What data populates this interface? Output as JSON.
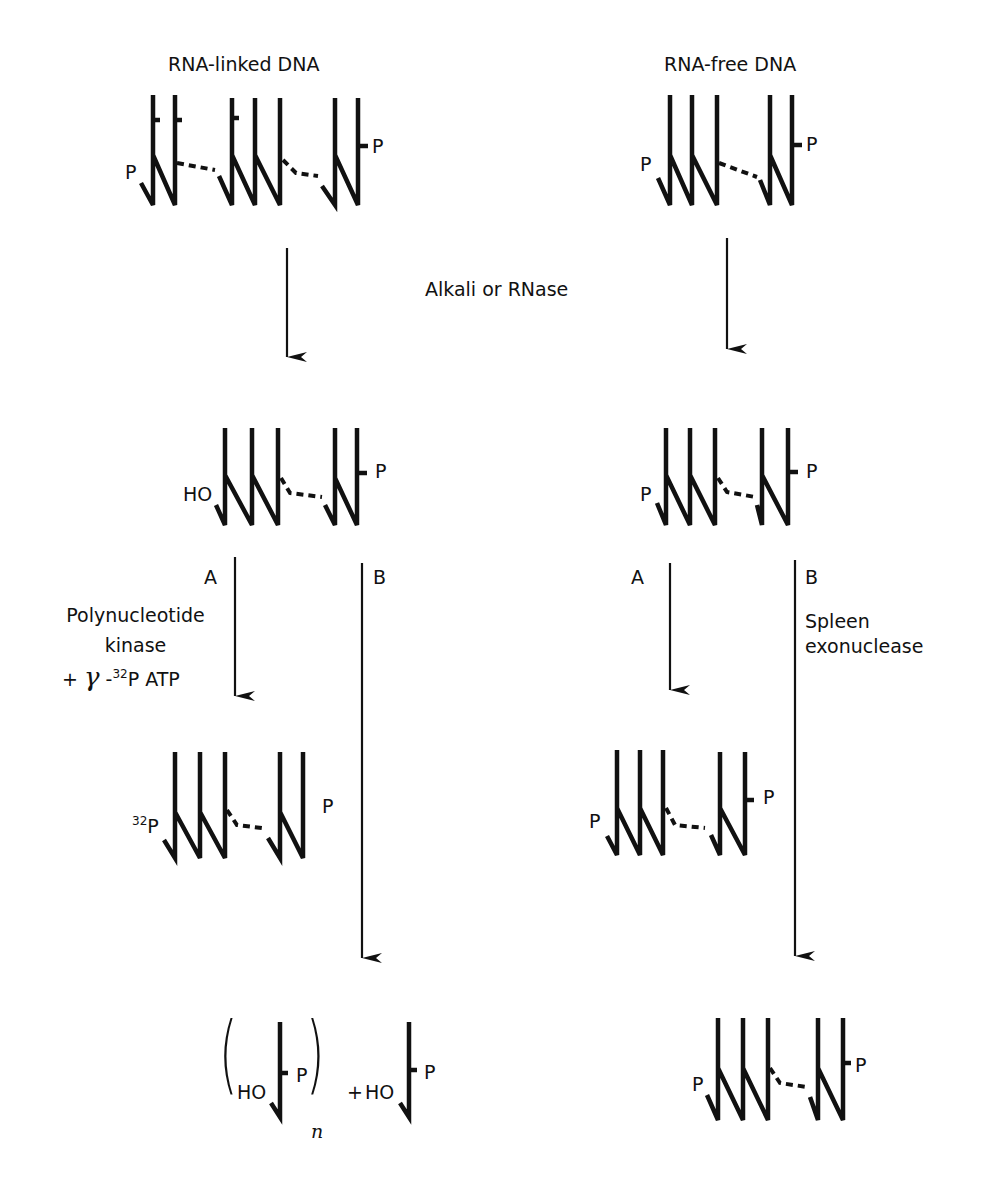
{
  "title_left": "RNA-linked DNA",
  "title_right": "RNA-free DNA",
  "treatment_label": "Alkali or RNase",
  "left_pathway": {
    "start": {
      "left_end": "P",
      "right_end": "P",
      "rna_primers": 3
    },
    "after_treatment": {
      "left_end": "HO",
      "right_end": "P"
    },
    "route_a": {
      "label": "A",
      "enzyme": [
        "Polynucleotide",
        "kinase"
      ],
      "reagent_prefix": "+",
      "reagent_gamma": "γ",
      "reagent_dash": "-",
      "reagent_isotope": "32",
      "reagent_rest": "P ATP",
      "product": {
        "left_end_isotope": "32",
        "left_end": "P",
        "right_end": "P"
      }
    },
    "route_b": {
      "label": "B",
      "product": {
        "open_paren": "(",
        "close_paren": ")",
        "inner_left": "HO",
        "inner_right": "P",
        "subscript": "n",
        "plus": "+",
        "free_left": "HO",
        "free_right": "P"
      }
    }
  },
  "right_pathway": {
    "start": {
      "left_end": "P",
      "right_end": "P"
    },
    "after_treatment": {
      "left_end": "P",
      "right_end": "P"
    },
    "route_a": {
      "label": "A",
      "product": {
        "left_end": "P",
        "right_end": "P"
      }
    },
    "route_b": {
      "label": "B",
      "enzyme": [
        "Spleen",
        "exonuclease"
      ],
      "product": {
        "left_end": "P",
        "right_end": "P"
      }
    }
  },
  "colors": {
    "ink": "#111111",
    "background": "#ffffff"
  }
}
